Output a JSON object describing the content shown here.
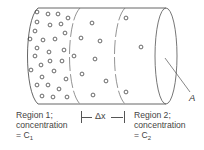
{
  "figure": {
    "type": "diffusion-cylinder-diagram",
    "region1": {
      "line1": "Region 1;",
      "line2": "concentration",
      "line3_prefix": "= C",
      "line3_sub": "1"
    },
    "region2": {
      "line1": "Region 2;",
      "line2": "concentration",
      "line3_prefix": "= C",
      "line3_sub": "2"
    },
    "delta_x_label": "Δx",
    "area_label": "A",
    "colors": {
      "line": "#555555",
      "dot": "#444444",
      "background": "#ffffff"
    },
    "particles": {
      "region1": [
        [
          37,
          12
        ],
        [
          48,
          14
        ],
        [
          58,
          14
        ],
        [
          68,
          18
        ],
        [
          37,
          22
        ],
        [
          50,
          25
        ],
        [
          61,
          24
        ],
        [
          35,
          31
        ],
        [
          65,
          33
        ],
        [
          30,
          39
        ],
        [
          43,
          40
        ],
        [
          55,
          39
        ],
        [
          37,
          48
        ],
        [
          49,
          52
        ],
        [
          64,
          50
        ],
        [
          35,
          56
        ],
        [
          50,
          61
        ],
        [
          62,
          61
        ],
        [
          31,
          70
        ],
        [
          41,
          65
        ],
        [
          54,
          71
        ],
        [
          42,
          77
        ],
        [
          66,
          79
        ],
        [
          37,
          85
        ],
        [
          48,
          85
        ],
        [
          59,
          89
        ],
        [
          42,
          96
        ],
        [
          53,
          97
        ],
        [
          67,
          97
        ]
      ],
      "middle": [
        [
          92,
          23
        ],
        [
          81,
          38
        ],
        [
          100,
          41
        ],
        [
          74,
          56
        ],
        [
          95,
          59
        ],
        [
          82,
          74
        ],
        [
          106,
          81
        ],
        [
          93,
          95
        ]
      ],
      "region2": [
        [
          126,
          18
        ],
        [
          141,
          47
        ],
        [
          126,
          92
        ]
      ]
    }
  }
}
